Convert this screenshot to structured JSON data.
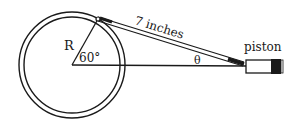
{
  "diagram": {
    "labels": {
      "radius": "R",
      "angle": "60°",
      "rod_length": "7 inches",
      "theta": "θ",
      "piston": "piston"
    },
    "geometry": {
      "center": [
        72,
        65
      ],
      "outer_radius": 53,
      "inner_radius": 48,
      "crank_pin": [
        98,
        19
      ],
      "piston_pin": [
        245,
        66
      ],
      "crank_angle_deg": 60
    },
    "colors": {
      "stroke": "#1a1a1a",
      "background": "#ffffff"
    }
  }
}
